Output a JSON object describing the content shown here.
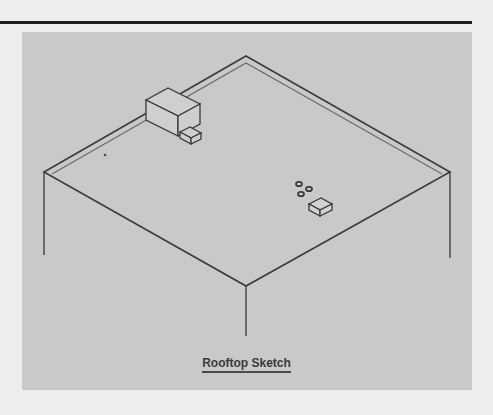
{
  "figure": {
    "caption": "Rooftop Sketch",
    "colors": {
      "page_background": "#ededed",
      "panel_background": "#c9c9c9",
      "line": "#3a3a3a",
      "rule": "#1e1e1e"
    },
    "elements": [
      {
        "name": "roof-outline",
        "description": "isometric square roof with double-line parapet edge"
      },
      {
        "name": "corner-posts",
        "description": "three vertical building edges below roof corners"
      },
      {
        "name": "rooftop-unit",
        "description": "large box unit with small attached box near top-left parapet"
      },
      {
        "name": "vents",
        "description": "three small circular vents"
      },
      {
        "name": "small-unit",
        "description": "small box unit near the vents"
      },
      {
        "name": "dot",
        "description": "small dot on roof near left side"
      }
    ]
  }
}
